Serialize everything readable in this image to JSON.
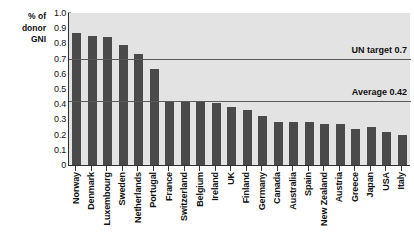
{
  "chart_data": {
    "type": "bar",
    "title": "",
    "subtitle": "",
    "xlabel": "",
    "ylabel": "% of\ndonor\nGNI",
    "ylim": [
      0,
      1.0
    ],
    "ytick_labels": [
      "1.0",
      "0.9",
      "0.8",
      "0.7",
      "0.6",
      "0.5",
      "0.4",
      "0.3",
      "0.2",
      "0.1",
      "0"
    ],
    "ytick_values": [
      1.0,
      0.9,
      0.8,
      0.7,
      0.6,
      0.5,
      0.4,
      0.3,
      0.2,
      0.1,
      0
    ],
    "grid": false,
    "legend": null,
    "bar_color": "#4a4a4a",
    "plot_background": "#e3e3e3",
    "categories": [
      "Norway",
      "Denmark",
      "Luxembourg",
      "Sweden",
      "Netherlands",
      "Portugal",
      "France",
      "Switzerland",
      "Belgium",
      "Ireland",
      "UK",
      "Finland",
      "Germany",
      "Canada",
      "Australia",
      "Spain",
      "New Zealand",
      "Austria",
      "Greece",
      "Japan",
      "USA",
      "Italy"
    ],
    "values": [
      0.87,
      0.85,
      0.84,
      0.79,
      0.73,
      0.63,
      0.42,
      0.42,
      0.42,
      0.41,
      0.38,
      0.36,
      0.32,
      0.28,
      0.28,
      0.28,
      0.27,
      0.27,
      0.24,
      0.25,
      0.22,
      0.2
    ],
    "annotations": [
      {
        "label": "UN target 0.7",
        "value": 0.7
      },
      {
        "label": "Average 0.42",
        "value": 0.42
      }
    ]
  }
}
